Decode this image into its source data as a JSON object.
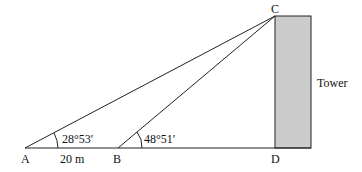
{
  "diagram": {
    "points": {
      "A": "A",
      "B": "B",
      "C": "C",
      "D": "D"
    },
    "angle_A": "28°53′",
    "angle_B": "48°51′",
    "distance_AB": "20 m",
    "tower_label": "Tower",
    "colors": {
      "line": "#222222",
      "tower_fill": "#cccccc"
    }
  }
}
